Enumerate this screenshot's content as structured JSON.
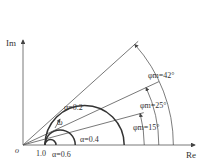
{
  "axes": {
    "x_label": "Re",
    "y_label": "Im",
    "origin_label": "o",
    "tick_label": "1.0"
  },
  "curves": [
    {
      "label": "α=0.2",
      "alpha": 0.2,
      "phi_m_deg": 42
    },
    {
      "label": "α=0.4",
      "alpha": 0.4,
      "phi_m_deg": 25
    },
    {
      "label": "α=0.6",
      "alpha": 0.6,
      "phi_m_deg": 15
    }
  ],
  "angle_labels": [
    {
      "text": "φm=42°",
      "deg": 42
    },
    {
      "text": "φm=25°",
      "deg": 25
    },
    {
      "text": "φm=15°",
      "deg": 15
    }
  ],
  "omega_label": "ω",
  "colors": {
    "line": "#555555",
    "curve": "#333333"
  }
}
